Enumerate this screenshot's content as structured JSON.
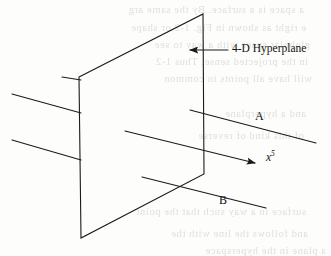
{
  "figure": {
    "background_color": "#fdfdfc",
    "stroke_color": "#1a1a1a",
    "ghost_text_color": "#c9c6c0"
  },
  "labels": {
    "hyperplane": "4-D Hyperplane",
    "line_a": "A",
    "line_b": "B",
    "axis_x5_base": "x",
    "axis_x5_sup": "5"
  },
  "geometry": {
    "hyperplane_polygon": [
      [
        79,
        77
      ],
      [
        203,
        14
      ],
      [
        204,
        174
      ],
      [
        81,
        238
      ]
    ],
    "line_a_left": [
      [
        12,
        94
      ],
      [
        81,
        113
      ]
    ],
    "line_a_right": [
      [
        190,
        110
      ],
      [
        316,
        143
      ]
    ],
    "line_b_left": [
      [
        12,
        140
      ],
      [
        81,
        160
      ]
    ],
    "line_b_right": [
      [
        142,
        177
      ],
      [
        266,
        208
      ]
    ],
    "stub_top_left": [
      [
        62,
        77
      ],
      [
        81,
        80
      ]
    ],
    "axis_x5_arrow": [
      [
        125,
        131
      ],
      [
        259,
        164
      ]
    ],
    "leader_hyperplane": [
      [
        228,
        50
      ],
      [
        186,
        50
      ]
    ]
  },
  "ghost_text": [
    {
      "text": "a  space  is  a  surface.  By  the  same  arg",
      "x": 4,
      "y": 4,
      "size": 10.5
    },
    {
      "text": "e  right  as  shown  in  Fig.  1-2  or  shape",
      "x": 6,
      "y": 22,
      "size": 10.5
    },
    {
      "text": "globular  space  with  a  way  to  see",
      "x": 10,
      "y": 39,
      "size": 10.5
    },
    {
      "text": "in  the  projected  sense.  Thus  1-2",
      "x": 8,
      "y": 56,
      "size": 10.5
    },
    {
      "text": "will  have  all  points  in  common",
      "x": 12,
      "y": 73,
      "size": 10.5
    },
    {
      "text": "and  a  hyperplane",
      "x": 6,
      "y": 108,
      "size": 10.5
    },
    {
      "text": "of  this  kind  of  reverse",
      "x": 4,
      "y": 130,
      "size": 10.5
    },
    {
      "text": "surface  in  a  way  such  that  the  point",
      "x": 6,
      "y": 206,
      "size": 10.5
    },
    {
      "text": "and  follows  the  line  with  the",
      "x": 8,
      "y": 228,
      "size": 10.5
    },
    {
      "text": "a  plane  in  the  hyperspace",
      "x": 26,
      "y": 245,
      "size": 10.5
    }
  ]
}
